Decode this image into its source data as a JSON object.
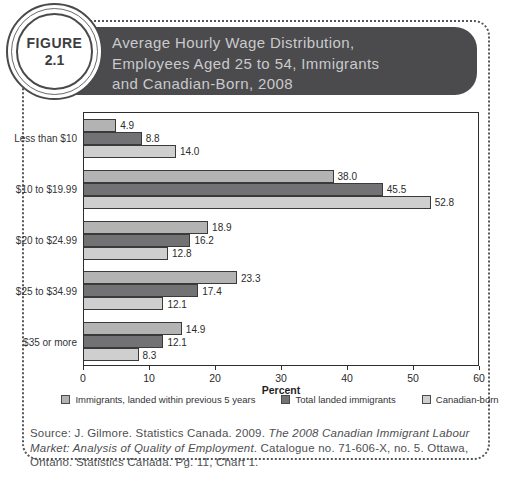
{
  "figure_badge": {
    "label": "FIGURE",
    "number": "2.1"
  },
  "header": {
    "title_lines": [
      "Average Hourly Wage Distribution,",
      "Employees Aged 25 to 54, Immigrants",
      "and Canadian-Born, 2008"
    ]
  },
  "chart_data": {
    "type": "bar",
    "orientation": "horizontal",
    "categories": [
      "Less than $10",
      "$10 to $19.99",
      "$20 to $24.99",
      "$25 to $34.99",
      "$35 or more"
    ],
    "series": [
      {
        "name": "Immigrants, landed within previous 5 years",
        "color": "#b3b3b3",
        "values": [
          4.9,
          38.0,
          18.9,
          23.3,
          14.9
        ]
      },
      {
        "name": "Total landed immigrants",
        "color": "#727274",
        "values": [
          8.8,
          45.5,
          16.2,
          17.4,
          12.1
        ]
      },
      {
        "name": "Canadian-born",
        "color": "#cfcfcf",
        "values": [
          14.0,
          52.8,
          12.8,
          12.1,
          8.3
        ]
      }
    ],
    "xlabel": "Percent",
    "xlim": [
      0,
      60
    ],
    "xticks": [
      0,
      10,
      20,
      30,
      40,
      50,
      60
    ],
    "grid": false,
    "legend_position": "bottom"
  },
  "source": {
    "prefix": "Source: J. Gilmore. Statistics Canada. 2009. ",
    "italic": "The 2008 Canadian Immigrant Labour Market: Analysis of Quality of Employment",
    "suffix": ". Catalogue no. 71-606-X, no. 5. Ottawa, Ontario. Statistics Canada. Pg. 11, Chart 1."
  }
}
